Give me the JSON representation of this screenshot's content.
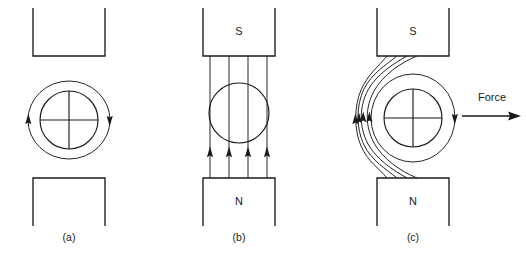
{
  "figure": {
    "background_color": "#ffffff",
    "line_color": "#1a1a1a",
    "panels": [
      {
        "id": "a",
        "caption": "(a)",
        "description": "Conductor carrying current between unmagnetized pole pieces; circular field around conductor only",
        "conductor": {
          "symbol": "cross",
          "meaning": "current into page",
          "has_surrounding_field_ring": true,
          "field_direction": "clockwise"
        },
        "poles": [
          {
            "position": "top",
            "label": "",
            "shape": "u-open-top"
          },
          {
            "position": "bottom",
            "label": "",
            "shape": "u-open-bottom"
          }
        ],
        "field_lines": []
      },
      {
        "id": "b",
        "caption": "(b)",
        "description": "Uniform magnet field between N and S poles, no current in conductor",
        "conductor": {
          "symbol": "none",
          "meaning": "no current",
          "has_surrounding_field_ring": false,
          "field_direction": ""
        },
        "poles": [
          {
            "position": "top",
            "label": "S",
            "shape": "u-open-top"
          },
          {
            "position": "bottom",
            "label": "N",
            "shape": "u-open-bottom"
          }
        ],
        "field_lines": [
          {
            "shape": "straight",
            "direction": "up",
            "count": 4
          }
        ]
      },
      {
        "id": "c",
        "caption": "(c)",
        "description": "Combined field: lines crowd on the left and thin on the right producing a force to the right",
        "conductor": {
          "symbol": "cross",
          "meaning": "current into page",
          "has_surrounding_field_ring": true,
          "field_direction": "clockwise"
        },
        "poles": [
          {
            "position": "top",
            "label": "S",
            "shape": "u-open-top"
          },
          {
            "position": "bottom",
            "label": "N",
            "shape": "u-open-bottom"
          }
        ],
        "field_lines": [
          {
            "shape": "curved-left",
            "direction": "up",
            "count": 4
          }
        ],
        "force": {
          "label": "Force",
          "direction": "right"
        }
      }
    ]
  }
}
